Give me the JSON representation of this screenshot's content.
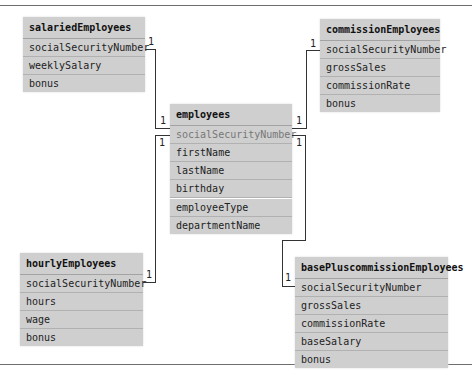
{
  "diagram": {
    "tables": {
      "salaried": {
        "name": "salariedEmployees",
        "fields": [
          "socialSecurityNumber",
          "weeklySalary",
          "bonus"
        ]
      },
      "commission": {
        "name": "commissionEmployees",
        "fields": [
          "socialSecurityNumber",
          "grossSales",
          "commissionRate",
          "bonus"
        ]
      },
      "employees": {
        "name": "employees",
        "fields": [
          "socialSecurityNumber",
          "firstName",
          "lastName",
          "birthday",
          "employeeType",
          "departmentName"
        ]
      },
      "hourly": {
        "name": "hourlyEmployees",
        "fields": [
          "socialSecurityNumber",
          "hours",
          "wage",
          "bonus"
        ]
      },
      "basePlus": {
        "name": "basePluscommissionEmployees",
        "fields": [
          "socialSecurityNumber",
          "grossSales",
          "commissionRate",
          "baseSalary",
          "bonus"
        ]
      }
    },
    "relationships": [
      {
        "from": "salariedEmployees",
        "to": "employees",
        "from_mult": "1",
        "to_mult": "1"
      },
      {
        "from": "commissionEmployees",
        "to": "employees",
        "from_mult": "1",
        "to_mult": "1"
      },
      {
        "from": "hourlyEmployees",
        "to": "employees",
        "from_mult": "1",
        "to_mult": "1"
      },
      {
        "from": "basePluscommissionEmployees",
        "to": "employees",
        "from_mult": "1",
        "to_mult": "1"
      }
    ],
    "multiplicity_label": "1"
  }
}
